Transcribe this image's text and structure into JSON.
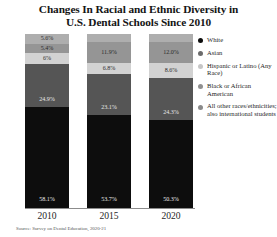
{
  "title": {
    "line1": "Changes In Racial and Ethnic Diversity in",
    "line2": "U.S. Dental Schools Since 2010"
  },
  "source": "Source: Survey on Dental Education, 2020-21",
  "legend": {
    "items": [
      {
        "label": "White",
        "color": "#0d0d0d"
      },
      {
        "label": "Asian",
        "color": "#6b6b6b"
      },
      {
        "label": "Hispanic or Latino (Any Race)",
        "color": "#c6c6c6"
      },
      {
        "label": "Black or African American",
        "color": "#909090"
      },
      {
        "label": "All other races/ethnicities; also international students",
        "color": "#8a8a8a"
      }
    ]
  },
  "chart_data": {
    "type": "bar",
    "subtype": "stacked-100-percent",
    "title": "Changes In Racial and Ethnic Diversity in U.S. Dental Schools Since 2010",
    "xlabel": "",
    "ylabel": "",
    "ylim": [
      0,
      100
    ],
    "grid": false,
    "legend_position": "right",
    "categories": [
      "2010",
      "2015",
      "2020"
    ],
    "series": [
      {
        "name": "White",
        "color": "#0d0d0d",
        "values": [
          58.1,
          53.7,
          50.3
        ],
        "labels": [
          "58.1%",
          "53.7%",
          "50.3%"
        ]
      },
      {
        "name": "Black or African American",
        "color": "#555555",
        "values": [
          24.9,
          23.1,
          24.3
        ],
        "labels": [
          "24.9%",
          "23.1%",
          "24.3%"
        ]
      },
      {
        "name": "Hispanic or Latino (Any Race)",
        "color": "#d2d2d2",
        "values": [
          6.0,
          6.8,
          8.6
        ],
        "labels": [
          "6%",
          "6.8%",
          "8.6%"
        ]
      },
      {
        "name": "Asian",
        "color": "#959595",
        "values": [
          5.4,
          11.9,
          12.0
        ],
        "labels": [
          "5.4%",
          "11.9%",
          "12.0%"
        ]
      },
      {
        "name": "All other races/ethnicities; also international students",
        "color": "#aeaeae",
        "values": [
          5.6,
          4.5,
          4.8
        ],
        "labels": [
          "5.6%",
          "",
          ""
        ]
      }
    ],
    "bars": [
      {
        "year": "2010",
        "segments": [
          {
            "name": "all-other",
            "label": "5.6%",
            "value": 5.6,
            "color": "#aeaeae",
            "text": "light"
          },
          {
            "name": "asian",
            "label": "5.4%",
            "value": 5.4,
            "color": "#959595",
            "text": "light"
          },
          {
            "name": "hispanic-latino",
            "label": "6%",
            "value": 6.0,
            "color": "#d2d2d2",
            "text": "light"
          },
          {
            "name": "black-african-american",
            "label": "24.9%",
            "value": 24.9,
            "color": "#555555",
            "text": "dark"
          },
          {
            "name": "white",
            "label": "58.1%",
            "value": 58.1,
            "color": "#0d0d0d",
            "text": "dark"
          }
        ]
      },
      {
        "year": "2015",
        "segments": [
          {
            "name": "all-other",
            "label": "",
            "value": 4.5,
            "color": "#aeaeae",
            "text": "light"
          },
          {
            "name": "asian",
            "label": "11.9%",
            "value": 11.9,
            "color": "#959595",
            "text": "light"
          },
          {
            "name": "hispanic-latino",
            "label": "6.8%",
            "value": 6.8,
            "color": "#d2d2d2",
            "text": "light"
          },
          {
            "name": "black-african-american",
            "label": "23.1%",
            "value": 23.1,
            "color": "#555555",
            "text": "dark"
          },
          {
            "name": "white",
            "label": "53.7%",
            "value": 53.7,
            "color": "#0d0d0d",
            "text": "dark"
          }
        ]
      },
      {
        "year": "2020",
        "segments": [
          {
            "name": "all-other",
            "label": "",
            "value": 4.8,
            "color": "#aeaeae",
            "text": "light"
          },
          {
            "name": "asian",
            "label": "12.0%",
            "value": 12.0,
            "color": "#959595",
            "text": "light"
          },
          {
            "name": "hispanic-latino",
            "label": "8.6%",
            "value": 8.6,
            "color": "#d2d2d2",
            "text": "light"
          },
          {
            "name": "black-african-american",
            "label": "24.3%",
            "value": 24.3,
            "color": "#555555",
            "text": "dark"
          },
          {
            "name": "white",
            "label": "50.3%",
            "value": 50.3,
            "color": "#0d0d0d",
            "text": "dark"
          }
        ]
      }
    ]
  }
}
